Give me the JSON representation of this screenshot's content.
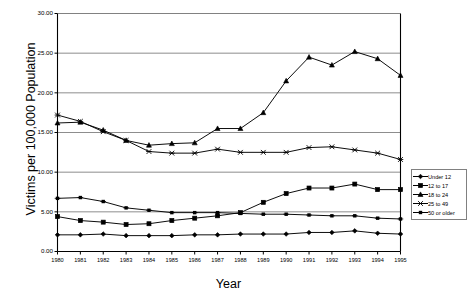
{
  "chart_data": {
    "type": "line",
    "title": "",
    "xlabel": "Year",
    "ylabel": "Victims per 100,000 Population",
    "x": [
      1980,
      1981,
      1982,
      1983,
      1984,
      1985,
      1986,
      1987,
      1988,
      1989,
      1990,
      1991,
      1992,
      1993,
      1994,
      1995
    ],
    "xtick_labels": [
      "1980",
      "1981",
      "1982",
      "1983",
      "1984",
      "1985",
      "1986",
      "1987",
      "1988",
      "1989",
      "1990",
      "1991",
      "1992",
      "1993",
      "1994",
      "1995"
    ],
    "ytick_labels": [
      "0.00",
      "5.00",
      "10.00",
      "15.00",
      "20.00",
      "25.00",
      "30.00"
    ],
    "ylim": [
      0,
      30
    ],
    "ytick_step": 5,
    "grid": "horizontal",
    "legend_position": "right-middle",
    "series": [
      {
        "name": "Under 12",
        "marker": "diamond",
        "values": [
          2.1,
          2.1,
          2.2,
          2.0,
          2.0,
          2.0,
          2.1,
          2.1,
          2.2,
          2.2,
          2.2,
          2.4,
          2.4,
          2.6,
          2.3,
          2.2
        ]
      },
      {
        "name": "12 to 17",
        "marker": "square",
        "values": [
          4.4,
          3.9,
          3.7,
          3.4,
          3.5,
          3.9,
          4.2,
          4.5,
          4.9,
          6.2,
          7.3,
          8.0,
          8.0,
          8.5,
          7.8,
          7.8
        ]
      },
      {
        "name": "18 to 24",
        "marker": "triangle",
        "values": [
          16.2,
          16.3,
          15.3,
          14.0,
          13.4,
          13.6,
          13.7,
          15.5,
          15.5,
          17.5,
          21.5,
          24.5,
          23.5,
          25.2,
          24.3,
          22.2
        ]
      },
      {
        "name": "25 to 49",
        "marker": "x",
        "values": [
          17.2,
          16.4,
          15.1,
          14.0,
          12.6,
          12.4,
          12.4,
          12.9,
          12.5,
          12.5,
          12.5,
          13.1,
          13.2,
          12.8,
          12.4,
          11.6
        ]
      },
      {
        "name": "50 or older",
        "marker": "asterisk",
        "values": [
          6.7,
          6.8,
          6.3,
          5.5,
          5.2,
          4.9,
          4.9,
          4.9,
          4.8,
          4.7,
          4.7,
          4.6,
          4.5,
          4.5,
          4.2,
          4.1
        ]
      }
    ]
  },
  "colors": {
    "axis": "#000000",
    "grid": "#808080",
    "series_line": "#000000",
    "legend_border": "#808080",
    "background": "#ffffff"
  }
}
